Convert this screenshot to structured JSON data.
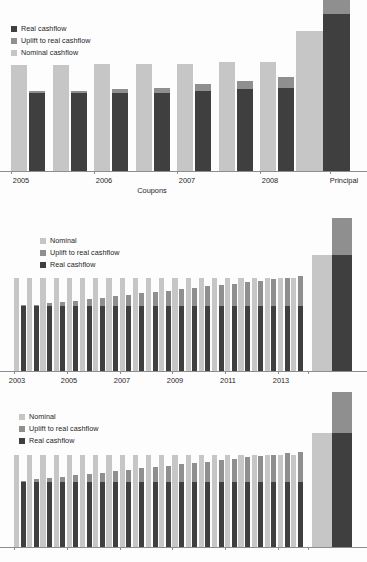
{
  "figure": {
    "background": "#fdfdfd",
    "colors": {
      "nominal": "#c6c6c6",
      "uplift": "#8f8f8f",
      "real": "#3f3f3f",
      "axis": "#8d8d8d",
      "text": "#1d1d1d"
    }
  },
  "charts": [
    {
      "id": "chart1",
      "legend": {
        "position": "top-left",
        "entries": [
          {
            "label": "Real cashflow",
            "color": "#3f3f3f",
            "key": "real"
          },
          {
            "label": "Uplift to real cashflow",
            "color": "#8f8f8f",
            "key": "uplift"
          },
          {
            "label": "Nominal cashflow",
            "color": "#c6c6c6",
            "key": "nominal"
          }
        ]
      },
      "chart_data": {
        "type": "bar",
        "title": "",
        "subtitle": "",
        "xlabel": "Coupons",
        "ylabel": "",
        "grid": false,
        "legend_position": "top-left",
        "note": "Grouped bars: a light Nominal cashflow bar beside a Real cashflow bar capped with an Uplift to real cashflow segment. Final group is Principal.",
        "categories": [
          "2005 H1",
          "2005 H2",
          "2006 H1",
          "2006 H2",
          "2007 H1",
          "2007 H2",
          "2008 H1",
          "2008 H2",
          "Principal"
        ],
        "tick_labels": [
          "2005",
          "2006",
          "2007",
          "2008",
          "Principal"
        ],
        "ylim": [
          0,
          100
        ],
        "series": [
          {
            "name": "Nominal cashflow",
            "key": "nominal",
            "values": [
              62,
              62,
              63,
              63,
              63,
              64,
              64,
              64,
              82
            ]
          },
          {
            "name": "Real cashflow",
            "key": "real",
            "values": [
              46,
              46,
              46,
              46,
              47,
              48,
              49,
              49,
              92
            ]
          },
          {
            "name": "Uplift to real cashflow",
            "key": "uplift",
            "values": [
              1,
              1,
              2,
              3,
              4,
              5,
              6,
              7,
              10
            ]
          }
        ]
      }
    },
    {
      "id": "chart2",
      "legend": {
        "position": "upper-left",
        "entries": [
          {
            "label": "Nominal",
            "color": "#c6c6c6",
            "key": "nominal"
          },
          {
            "label": "Uplift to real cashflow",
            "color": "#8f8f8f",
            "key": "uplift"
          },
          {
            "label": "Real cashflow",
            "color": "#3f3f3f",
            "key": "real"
          }
        ]
      },
      "chart_data": {
        "type": "bar",
        "title": "",
        "xlabel": "",
        "ylabel": "",
        "grid": false,
        "legend_position": "upper-left",
        "note": "Semi-annual coupons 2003 to 2013 plus a Principal group at the right. Nominal bars are flat; Real cashflow bars are flat with an Uplift cap that grows over time.",
        "categories": [
          "2003 H1",
          "2003 H2",
          "2004 H1",
          "2004 H2",
          "2005 H1",
          "2005 H2",
          "2006 H1",
          "2006 H2",
          "2007 H1",
          "2007 H2",
          "2008 H1",
          "2008 H2",
          "2009 H1",
          "2009 H2",
          "2010 H1",
          "2010 H2",
          "2011 H1",
          "2011 H2",
          "2012 H1",
          "2012 H2",
          "2013 H1",
          "2013 H2",
          "Principal"
        ],
        "tick_labels": [
          "2003",
          "2005",
          "2007",
          "2009",
          "2011",
          "2013"
        ],
        "ylim": [
          0,
          100
        ],
        "series": [
          {
            "name": "Nominal",
            "key": "nominal",
            "values": [
              66,
              66,
              66,
              66,
              66,
              66,
              66,
              66,
              66,
              66,
              66,
              66,
              66,
              66,
              66,
              66,
              66,
              66,
              66,
              66,
              66,
              66,
              82
            ]
          },
          {
            "name": "Real cashflow",
            "key": "real",
            "values": [
              46,
              46,
              46,
              46,
              46,
              46,
              46,
              46,
              46,
              46,
              46,
              46,
              46,
              46,
              46,
              46,
              46,
              46,
              46,
              46,
              46,
              46,
              82
            ]
          },
          {
            "name": "Uplift to real cashflow",
            "key": "uplift",
            "values": [
              1,
              1,
              2,
              3,
              4,
              5,
              6,
              7,
              8,
              9,
              10,
              11,
              12,
              13,
              14,
              15,
              16,
              17,
              18,
              19,
              20,
              21,
              26
            ]
          }
        ]
      }
    },
    {
      "id": "chart3",
      "legend": {
        "position": "upper-left",
        "entries": [
          {
            "label": "Nominal",
            "color": "#c6c6c6",
            "key": "nominal"
          },
          {
            "label": "Uplift to real cashflow",
            "color": "#8f8f8f",
            "key": "uplift"
          },
          {
            "label": "Real cashflow",
            "color": "#3f3f3f",
            "key": "real"
          }
        ]
      },
      "chart_data": {
        "type": "bar",
        "title": "",
        "xlabel": "",
        "ylabel": "",
        "grid": false,
        "legend_position": "upper-left",
        "note": "Bottom chart is cropped by the image edge; x tick marks are visible but tick labels are cut off. Principal bar extends above the visible area.",
        "categories": [
          "c1",
          "c2",
          "c3",
          "c4",
          "c5",
          "c6",
          "c7",
          "c8",
          "c9",
          "c10",
          "c11",
          "c12",
          "c13",
          "c14",
          "c15",
          "c16",
          "c17",
          "c18",
          "c19",
          "c20",
          "c21",
          "c22",
          "Principal"
        ],
        "tick_labels": [],
        "ylim": [
          0,
          100
        ],
        "series": [
          {
            "name": "Nominal",
            "key": "nominal",
            "values": [
              68,
              68,
              68,
              68,
              68,
              68,
              68,
              68,
              68,
              68,
              68,
              68,
              68,
              68,
              68,
              68,
              68,
              68,
              68,
              68,
              68,
              68,
              84
            ]
          },
          {
            "name": "Real cashflow",
            "key": "real",
            "values": [
              48,
              48,
              48,
              48,
              48,
              48,
              48,
              48,
              48,
              48,
              48,
              48,
              48,
              48,
              48,
              48,
              48,
              48,
              48,
              48,
              48,
              48,
              84
            ]
          },
          {
            "name": "Uplift to real cashflow",
            "key": "uplift",
            "values": [
              1,
              2,
              3,
              4,
              5,
              6,
              7,
              8,
              9,
              10,
              11,
              12,
              13,
              14,
              15,
              16,
              17,
              18,
              19,
              20,
              21,
              22,
              34
            ]
          }
        ]
      }
    }
  ]
}
